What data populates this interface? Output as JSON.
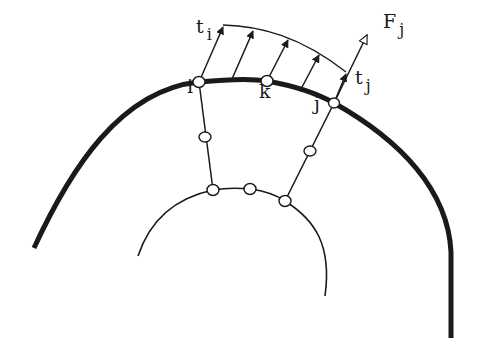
{
  "diagram": {
    "colors": {
      "stroke": "#1a1a1a",
      "background": "#ffffff",
      "node_fill": "#ffffff"
    },
    "outer_boundary": {
      "path": "M 34 248 C 70 170, 120 90, 199 82 C 230 79, 255 79, 267 81 C 295 86, 318 94, 334 103 C 400 140, 448 190, 451 252 L 451 338",
      "stroke_width": 5
    },
    "inner_boundary": {
      "path": "M 138 256 C 150 220, 175 198, 213 190 C 230 187, 240 188, 250 189 C 265 191, 275 194, 285 201 C 315 220, 332 245, 325 296",
      "stroke_width": 1.6
    },
    "element_edges": [
      {
        "name": "edge-left",
        "x1": 199,
        "y1": 82,
        "x2": 213,
        "y2": 190
      },
      {
        "name": "edge-right",
        "x1": 334,
        "y1": 103,
        "x2": 285,
        "y2": 201
      }
    ],
    "traction_envelope": {
      "path": "M 223 25 C 260 26, 300 36, 346 72"
    },
    "traction_arrows": [
      {
        "x1": 199,
        "y1": 82,
        "x2": 223,
        "y2": 27
      },
      {
        "x1": 232,
        "y1": 79,
        "x2": 253,
        "y2": 31
      },
      {
        "x1": 267,
        "y1": 81,
        "x2": 288,
        "y2": 40
      },
      {
        "x1": 301,
        "y1": 89,
        "x2": 319,
        "y2": 55
      },
      {
        "x1": 334,
        "y1": 103,
        "x2": 346,
        "y2": 74
      }
    ],
    "force_arrow": {
      "x1": 334,
      "y1": 103,
      "x2": 367,
      "y2": 35
    },
    "nodes": [
      {
        "name": "node-i",
        "cx": 199,
        "cy": 82,
        "rx": 6,
        "ry": 5.5
      },
      {
        "name": "node-k",
        "cx": 267,
        "cy": 81,
        "rx": 6,
        "ry": 5.5
      },
      {
        "name": "node-j",
        "cx": 334,
        "cy": 103,
        "rx": 5.5,
        "ry": 5
      },
      {
        "name": "node-left-mid",
        "cx": 205,
        "cy": 137,
        "rx": 6,
        "ry": 5
      },
      {
        "name": "node-right-mid",
        "cx": 310,
        "cy": 151,
        "rx": 6,
        "ry": 5
      },
      {
        "name": "node-inner-left",
        "cx": 213,
        "cy": 190,
        "rx": 6,
        "ry": 5.5
      },
      {
        "name": "node-inner-mid",
        "cx": 250,
        "cy": 189,
        "rx": 6,
        "ry": 5.5
      },
      {
        "name": "node-inner-right",
        "cx": 285,
        "cy": 201,
        "rx": 6,
        "ry": 5.5
      }
    ],
    "labels": {
      "t_i": {
        "main": "t",
        "sub": "i",
        "x": 196,
        "y": 33
      },
      "F_j": {
        "main": "F",
        "sub": "j",
        "x": 383,
        "y": 28
      },
      "t_j": {
        "main": "t",
        "sub": "j",
        "x": 355,
        "y": 84
      },
      "node_i": {
        "main": "i",
        "x": 187,
        "y": 93
      },
      "node_k": {
        "main": "k",
        "x": 259,
        "y": 98
      },
      "node_j": {
        "main": "j",
        "x": 314,
        "y": 110
      }
    }
  }
}
